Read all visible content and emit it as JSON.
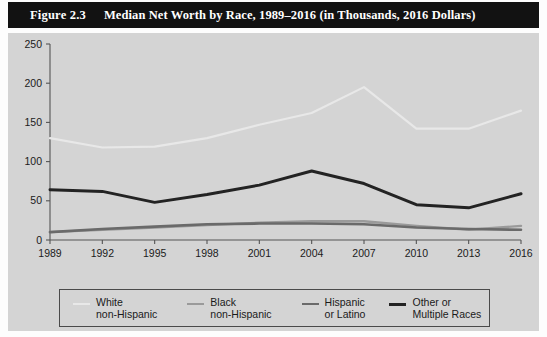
{
  "figure": {
    "number": "Figure 2.3",
    "title": "Median Net Worth by Race, 1989–2016 (in Thousands, 2016 Dollars)",
    "title_bar_color": "#121212",
    "panel_color": "#d4d4d4"
  },
  "legend": {
    "entries": [
      {
        "line1": "White",
        "line2": "non-Hispanic",
        "color": "#e8e8e8",
        "width": 2.2
      },
      {
        "line1": "Black",
        "line2": "non-Hispanic",
        "color": "#9a9a9a",
        "width": 2.4
      },
      {
        "line1": "Hispanic",
        "line2": "or Latino",
        "color": "#6a6a6a",
        "width": 2.6
      },
      {
        "line1": "Other or",
        "line2": "Multiple Races",
        "color": "#232323",
        "width": 3.0
      }
    ]
  },
  "chart_data": {
    "type": "line",
    "title": "Median Net Worth by Race, 1989–2016 (in Thousands, 2016 Dollars)",
    "xlabel": "",
    "ylabel": "",
    "categories": [
      "1989",
      "1992",
      "1995",
      "1998",
      "2001",
      "2004",
      "2007",
      "2010",
      "2013",
      "2016"
    ],
    "ylim": [
      0,
      250
    ],
    "yticks": [
      0,
      50,
      100,
      150,
      200,
      250
    ],
    "grid": false,
    "legend_position": "bottom",
    "series": [
      {
        "name": "White non-Hispanic",
        "color": "#e8e8e8",
        "stroke_width": 2.2,
        "values": [
          130,
          118,
          119,
          130,
          147,
          162,
          195,
          142,
          142,
          165
        ]
      },
      {
        "name": "Black non-Hispanic",
        "color": "#9a9a9a",
        "stroke_width": 2.4,
        "values": [
          10,
          13,
          16,
          19,
          22,
          24,
          24,
          18,
          13,
          18
        ]
      },
      {
        "name": "Hispanic or Latino",
        "color": "#6a6a6a",
        "stroke_width": 2.6,
        "values": [
          10,
          14,
          17,
          20,
          21,
          21,
          20,
          16,
          14,
          13
        ]
      },
      {
        "name": "Other or Multiple Races",
        "color": "#232323",
        "stroke_width": 3.0,
        "values": [
          64,
          62,
          48,
          58,
          70,
          88,
          72,
          45,
          41,
          59
        ]
      }
    ]
  }
}
